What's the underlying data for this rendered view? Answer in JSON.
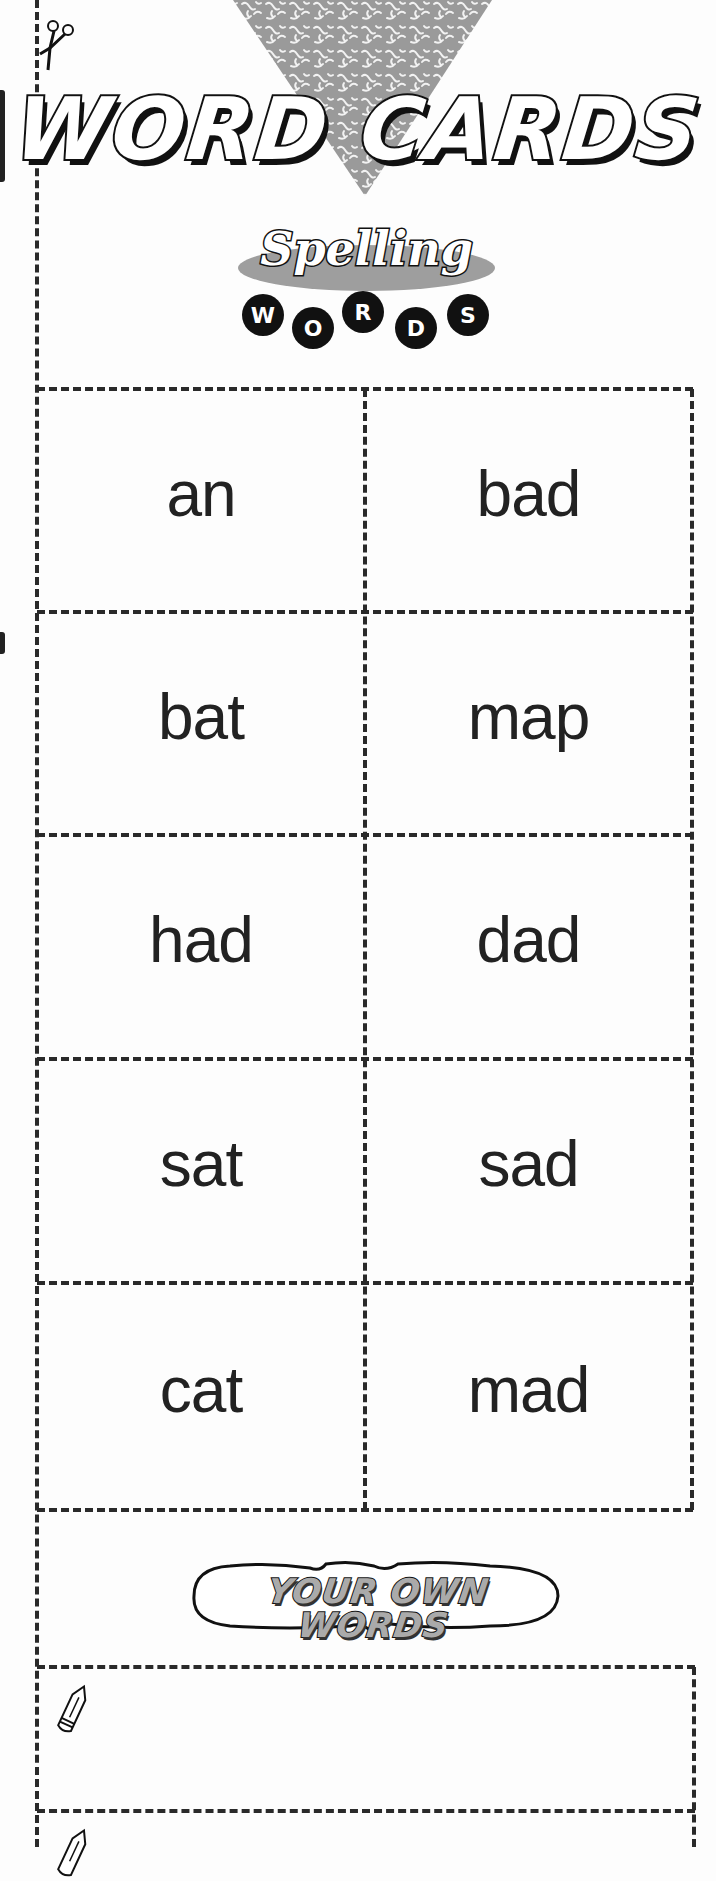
{
  "page": {
    "title": "WORD CARDS",
    "logo": {
      "script_text": "Spelling",
      "letters": [
        "W",
        "O",
        "R",
        "D",
        "S"
      ],
      "ellipse_color": "#9e9e9e"
    },
    "cards": [
      [
        "an",
        "bad"
      ],
      [
        "bat",
        "map"
      ],
      [
        "had",
        "dad"
      ],
      [
        "sat",
        "sad"
      ],
      [
        "cat",
        "mad"
      ]
    ],
    "your_own_words": {
      "label": "YOUR OWN WORDS",
      "write_boxes": [
        "",
        ""
      ]
    },
    "icons": {
      "cut_line": "scissors-icon",
      "write_prompt": "pencil-icon",
      "decoration": "textured-triangle"
    },
    "colors": {
      "ink": "#222222",
      "dash": "#2a2a2a",
      "triangle": "#9a9a9a",
      "paper": "#fdfdfd"
    }
  }
}
